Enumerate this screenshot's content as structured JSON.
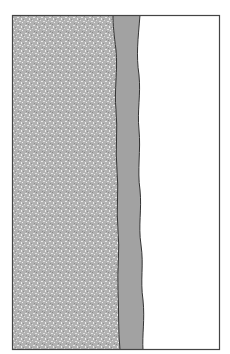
{
  "diagram": {
    "type": "cross-section",
    "layers": [
      {
        "name": "textured-substrate",
        "fill": "#b4b4b4",
        "speckle": "#e6e6e6"
      },
      {
        "name": "middle-band",
        "fill": "#a0a0a0"
      },
      {
        "name": "clear-region",
        "fill": "#ffffff"
      }
    ],
    "frame_color": "#444444",
    "boundary_color": "#333333"
  }
}
